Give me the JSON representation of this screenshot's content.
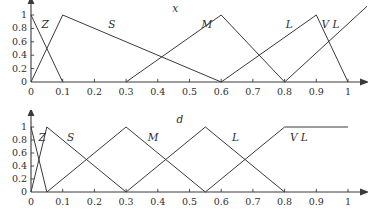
{
  "figure": {
    "width": 368,
    "height": 219,
    "stroke_color": "#3a3a3a",
    "background": "#ffffff"
  },
  "chart_data": [
    {
      "type": "line",
      "title": "x",
      "xlabel": "",
      "ylabel": "",
      "xlim": [
        0,
        1
      ],
      "ylim": [
        0,
        1
      ],
      "grid": false,
      "legend": "inline-annotations",
      "xticks": [
        "0",
        "0.1",
        "0.2",
        "0.3",
        "0.4",
        "0.5",
        "0.6",
        "0.7",
        "0.8",
        "0.9",
        "1"
      ],
      "xtick_values": [
        0,
        0.1,
        0.2,
        0.3,
        0.4,
        0.5,
        0.6,
        0.7,
        0.8,
        0.9,
        1
      ],
      "yticks": [
        "0",
        "0.2",
        "0.4",
        "0.6",
        "0.8",
        "1"
      ],
      "ytick_values": [
        0,
        0.2,
        0.4,
        0.6,
        0.8,
        1
      ],
      "series": [
        {
          "name": "Z",
          "label": "Z",
          "label_at": [
            0.045,
            0.86
          ],
          "x": [
            0,
            0.1
          ],
          "values": [
            1,
            0
          ]
        },
        {
          "name": "S",
          "label": "S",
          "label_at": [
            0.255,
            0.87
          ],
          "x": [
            0,
            0.1,
            0.6
          ],
          "values": [
            0,
            1,
            0
          ]
        },
        {
          "name": "M",
          "label": "M",
          "label_at": [
            0.555,
            0.86
          ],
          "x": [
            0.3,
            0.6,
            0.8
          ],
          "values": [
            0,
            1,
            0
          ]
        },
        {
          "name": "L",
          "label": "L",
          "label_at": [
            0.815,
            0.86
          ],
          "x": [
            0.6,
            0.9,
            1.0
          ],
          "values": [
            0,
            1,
            0
          ]
        },
        {
          "name": "VL",
          "label": "V L",
          "label_at": [
            0.945,
            0.86
          ],
          "x": [
            0.8,
            1.06
          ],
          "values": [
            0,
            1.13
          ]
        }
      ]
    },
    {
      "type": "line",
      "title": "d",
      "xlabel": "",
      "ylabel": "",
      "xlim": [
        0,
        1
      ],
      "ylim": [
        0,
        1
      ],
      "grid": false,
      "legend": "inline-annotations",
      "xticks": [
        "0",
        "0.1",
        "0.2",
        "0.3",
        "0.4",
        "0.5",
        "0.6",
        "0.7",
        "0.8",
        "0.9",
        "1"
      ],
      "xtick_values": [
        0,
        0.1,
        0.2,
        0.3,
        0.4,
        0.5,
        0.6,
        0.7,
        0.8,
        0.9,
        1
      ],
      "yticks": [
        "0",
        "0.2",
        "0.4",
        "0.6",
        "0.8",
        "1"
      ],
      "ytick_values": [
        0,
        0.2,
        0.4,
        0.6,
        0.8,
        1
      ],
      "series": [
        {
          "name": "Z",
          "label": "Z",
          "label_at": [
            0.035,
            0.85
          ],
          "x": [
            0,
            0.05
          ],
          "values": [
            1,
            0
          ]
        },
        {
          "name": "S",
          "label": "S",
          "label_at": [
            0.125,
            0.85
          ],
          "x": [
            0,
            0.05,
            0.3
          ],
          "values": [
            0,
            1,
            0
          ]
        },
        {
          "name": "M",
          "label": "M",
          "label_at": [
            0.385,
            0.85
          ],
          "x": [
            0.05,
            0.3,
            0.55
          ],
          "values": [
            0,
            1,
            0
          ]
        },
        {
          "name": "L",
          "label": "L",
          "label_at": [
            0.645,
            0.85
          ],
          "x": [
            0.3,
            0.55,
            0.8
          ],
          "values": [
            0,
            1,
            0
          ]
        },
        {
          "name": "VL",
          "label": "V L",
          "label_at": [
            0.845,
            0.85
          ],
          "x": [
            0.55,
            0.8,
            1.0
          ],
          "values": [
            0,
            1,
            1
          ]
        }
      ]
    }
  ]
}
